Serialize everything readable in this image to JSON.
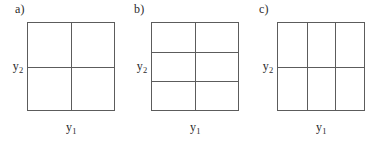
{
  "figure": {
    "background_color": "#ffffff",
    "line_color": "#5c5c5c",
    "text_color": "#2b2b2b",
    "width": 372,
    "height": 141
  },
  "panels": [
    {
      "id": "a",
      "label": "a)",
      "columns": 2,
      "rows": 2,
      "x_axis_label_text": "y",
      "x_axis_label_sub": "1",
      "y_axis_label_text": "y",
      "y_axis_label_sub": "2",
      "grid_left": 27,
      "grid_top": 22,
      "grid_width": 88,
      "grid_height": 89,
      "label_left": 15,
      "y_label_center": 67,
      "x_label_center": 71,
      "vertical_divider_fractions": [
        0.5
      ],
      "horizontal_divider_fractions": [
        0.5
      ]
    },
    {
      "id": "b",
      "label": "b)",
      "columns": 2,
      "rows": 3,
      "x_axis_label_text": "y",
      "x_axis_label_sub": "1",
      "y_axis_label_text": "y",
      "y_axis_label_sub": "2",
      "grid_left": 151,
      "grid_top": 22,
      "grid_width": 88,
      "grid_height": 89,
      "label_left": 134,
      "y_label_center": 67,
      "x_label_center": 195,
      "vertical_divider_fractions": [
        0.5
      ],
      "horizontal_divider_fractions": [
        0.333,
        0.666
      ]
    },
    {
      "id": "c",
      "label": "c)",
      "columns": 3,
      "rows": 2,
      "x_axis_label_text": "y",
      "x_axis_label_sub": "1",
      "y_axis_label_text": "y",
      "y_axis_label_sub": "2",
      "grid_left": 277,
      "grid_top": 22,
      "grid_width": 88,
      "grid_height": 89,
      "label_left": 259,
      "y_label_center": 67,
      "x_label_center": 321,
      "vertical_divider_fractions": [
        0.333,
        0.666
      ],
      "horizontal_divider_fractions": [
        0.5
      ]
    }
  ]
}
